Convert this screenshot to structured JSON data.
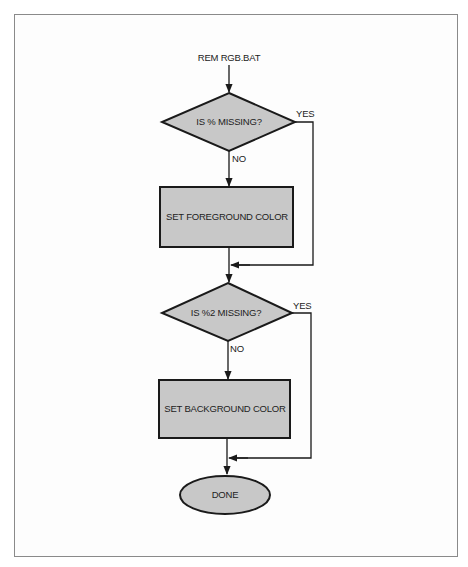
{
  "diagram": {
    "type": "flowchart",
    "colors": {
      "shape_fill": "#c8c8c8",
      "stroke": "#1a1a1a",
      "frame": "#8a8a8a"
    },
    "start_label": "REM RGB.BAT",
    "nodes": [
      {
        "id": "d1",
        "shape": "diamond",
        "label": "IS % MISSING?"
      },
      {
        "id": "p1",
        "shape": "rectangle",
        "label": "SET FOREGROUND COLOR"
      },
      {
        "id": "d2",
        "shape": "diamond",
        "label": "IS %2 MISSING?"
      },
      {
        "id": "p2",
        "shape": "rectangle",
        "label": "SET BACKGROUND COLOR"
      },
      {
        "id": "end",
        "shape": "oval",
        "label": "DONE"
      }
    ],
    "edges": [
      {
        "from": "start",
        "to": "d1",
        "label": ""
      },
      {
        "from": "d1",
        "to": "p1",
        "label": "NO"
      },
      {
        "from": "d1",
        "to": "d2",
        "label": "YES"
      },
      {
        "from": "p1",
        "to": "d2",
        "label": ""
      },
      {
        "from": "d2",
        "to": "p2",
        "label": "NO"
      },
      {
        "from": "d2",
        "to": "end",
        "label": "YES"
      },
      {
        "from": "p2",
        "to": "end",
        "label": ""
      }
    ],
    "edge_labels": {
      "yes1": "YES",
      "no1": "NO",
      "yes2": "YES",
      "no2": "NO"
    }
  }
}
